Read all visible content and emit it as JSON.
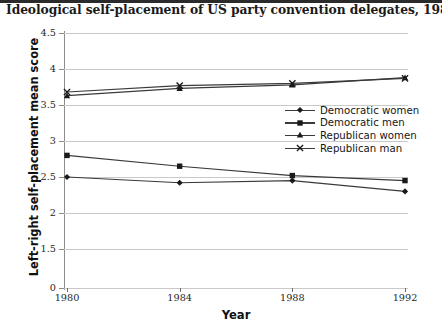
{
  "chart_data": {
    "type": "line",
    "title": "Ideological self-placement of US party convention delegates, 1980-92",
    "xlabel": "Year",
    "ylabel": "Left-right self-placement mean score",
    "categories": [
      "1980",
      "1984",
      "1988",
      "1992"
    ],
    "x": [
      1980,
      1984,
      1988,
      1992
    ],
    "ytick_labels": [
      "4.5",
      "4",
      "3.5",
      "3",
      "2.5",
      "2",
      "1.5",
      "0"
    ],
    "ytick_values": [
      4.5,
      4,
      3.5,
      3,
      2.5,
      2,
      1.5,
      0
    ],
    "ylim": [
      0,
      4.5
    ],
    "grid": true,
    "legend_position": "center-right",
    "series": [
      {
        "name": "Democratic women",
        "marker": "diamond",
        "values": [
          2.5,
          2.42,
          2.45,
          2.3
        ]
      },
      {
        "name": "Democratic men",
        "marker": "square",
        "values": [
          2.8,
          2.65,
          2.52,
          2.45
        ]
      },
      {
        "name": "Republican women",
        "marker": "triangle",
        "values": [
          3.63,
          3.73,
          3.78,
          3.88
        ]
      },
      {
        "name": "Republican man",
        "marker": "x",
        "values": [
          3.68,
          3.77,
          3.8,
          3.87
        ]
      }
    ],
    "colors": {
      "series_line": "#3a3a3a",
      "marker": "#1a1a1a",
      "grid": "#c9c9c9",
      "axis": "#8d8d8d",
      "text": "#1a1a1a"
    }
  }
}
